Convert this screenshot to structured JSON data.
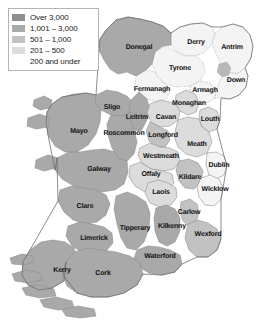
{
  "legend": {
    "name": "population-density-legend",
    "entries": [
      {
        "label": "Over 3,000",
        "color": "#8e8e8e",
        "min": 3001,
        "max": null,
        "has_swatch": true
      },
      {
        "label": "1,001 – 3,000",
        "color": "#a9a9a9",
        "min": 1001,
        "max": 3000,
        "has_swatch": true
      },
      {
        "label": "501 – 1,000",
        "color": "#c2c2c2",
        "min": 501,
        "max": 1000,
        "has_swatch": true
      },
      {
        "label": "201 – 500",
        "color": "#dcdcdc",
        "min": 201,
        "max": 500,
        "has_swatch": true
      },
      {
        "label": "200 and under",
        "color": "#f4f4f4",
        "min": 0,
        "max": 200,
        "has_swatch": false
      }
    ]
  },
  "chart_data": {
    "type": "map",
    "title": "",
    "subtitle": "",
    "map_region": "Ireland",
    "value_label": "Population density class",
    "legend_position": "top-left",
    "class_colors": [
      "#8e8e8e",
      "#a9a9a9",
      "#c2c2c2",
      "#dcdcdc",
      "#f4f4f4"
    ],
    "class_labels": [
      "Over 3,000",
      "1,001 – 3,000",
      "501 – 1,000",
      "201 – 500",
      "200 and under"
    ],
    "regions": [
      {
        "name": "Donegal",
        "class_index": 1,
        "label_x": 139,
        "label_y": 47
      },
      {
        "name": "Derry",
        "class_index": 4,
        "label_x": 196,
        "label_y": 42
      },
      {
        "name": "Antrim",
        "class_index": 4,
        "label_x": 232,
        "label_y": 47
      },
      {
        "name": "Tyrone",
        "class_index": 4,
        "label_x": 180,
        "label_y": 68
      },
      {
        "name": "Fermanagh",
        "class_index": 4,
        "label_x": 152,
        "label_y": 89
      },
      {
        "name": "Armagh",
        "class_index": 4,
        "label_x": 205,
        "label_y": 90
      },
      {
        "name": "Down",
        "class_index": 4,
        "label_x": 236,
        "label_y": 80
      },
      {
        "name": "Sligo",
        "class_index": 1,
        "label_x": 112,
        "label_y": 107
      },
      {
        "name": "Monaghan",
        "class_index": 3,
        "label_x": 189,
        "label_y": 103
      },
      {
        "name": "Leitrim",
        "class_index": 1,
        "label_x": 137,
        "label_y": 117
      },
      {
        "name": "Cavan",
        "class_index": 3,
        "label_x": 166,
        "label_y": 117
      },
      {
        "name": "Louth",
        "class_index": 3,
        "label_x": 210,
        "label_y": 119
      },
      {
        "name": "Mayo",
        "class_index": 1,
        "label_x": 79,
        "label_y": 131
      },
      {
        "name": "Roscommon",
        "class_index": 1,
        "label_x": 124,
        "label_y": 133
      },
      {
        "name": "Longford",
        "class_index": 2,
        "label_x": 163,
        "label_y": 135
      },
      {
        "name": "Meath",
        "class_index": 3,
        "label_x": 197,
        "label_y": 144
      },
      {
        "name": "Westmeath",
        "class_index": 3,
        "label_x": 161,
        "label_y": 156
      },
      {
        "name": "Galway",
        "class_index": 1,
        "label_x": 99,
        "label_y": 169
      },
      {
        "name": "Offaly",
        "class_index": 3,
        "label_x": 151,
        "label_y": 174
      },
      {
        "name": "Dublin",
        "class_index": 4,
        "label_x": 219,
        "label_y": 165
      },
      {
        "name": "Kildare",
        "class_index": 2,
        "label_x": 190,
        "label_y": 177
      },
      {
        "name": "Laois",
        "class_index": 3,
        "label_x": 161,
        "label_y": 192
      },
      {
        "name": "Wicklow",
        "class_index": 4,
        "label_x": 215,
        "label_y": 189
      },
      {
        "name": "Clare",
        "class_index": 1,
        "label_x": 85,
        "label_y": 206
      },
      {
        "name": "Carlow",
        "class_index": 2,
        "label_x": 189,
        "label_y": 212
      },
      {
        "name": "Tipperary",
        "class_index": 1,
        "label_x": 135,
        "label_y": 228
      },
      {
        "name": "Kilkenny",
        "class_index": 1,
        "label_x": 172,
        "label_y": 226
      },
      {
        "name": "Limerick",
        "class_index": 1,
        "label_x": 94,
        "label_y": 238
      },
      {
        "name": "Wexford",
        "class_index": 2,
        "label_x": 208,
        "label_y": 234
      },
      {
        "name": "Waterford",
        "class_index": 1,
        "label_x": 160,
        "label_y": 256
      },
      {
        "name": "Cork",
        "class_index": 1,
        "label_x": 103,
        "label_y": 273
      },
      {
        "name": "Kerry",
        "class_index": 1,
        "label_x": 62,
        "label_y": 270
      }
    ]
  }
}
